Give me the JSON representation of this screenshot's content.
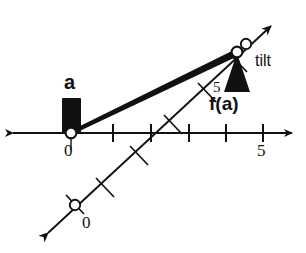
{
  "figure": {
    "title": "",
    "background_color": "#ffffff",
    "ink_color": "#111111"
  },
  "horizontal_axis": {
    "name": "input-axis",
    "origin_label": "0",
    "max_tick_label": "5",
    "tick_values": [
      1,
      2,
      3,
      4,
      5
    ],
    "tick_count": 5,
    "arrow_both_ends": true,
    "origin_marker": "open-circle"
  },
  "tilted_axis": {
    "name": "output-axis",
    "origin_label": "0",
    "max_tick_label": "5",
    "tick_values": [
      1,
      2,
      3,
      4,
      5
    ],
    "tick_count": 5,
    "arrow_both_ends": true,
    "origin_marker": "open-circle",
    "angle_label": "tilt"
  },
  "annotations": {
    "input_variable": "a",
    "output_expression": "f(a)",
    "tilt": "tilt"
  },
  "markers": {
    "slider_block": {
      "name": "input-slider-block",
      "fill": "#111111",
      "at_label": "a"
    },
    "fulcrum_triangle": {
      "name": "fulcrum-triangle",
      "fill": "#111111"
    },
    "lever_bar": {
      "name": "lever-bar",
      "fill": "#111111"
    },
    "pivot_point": {
      "name": "pivot-circle",
      "fill": "#ffffff"
    }
  }
}
